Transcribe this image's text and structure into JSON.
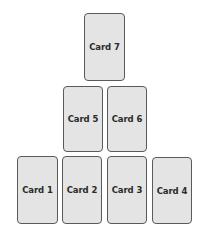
{
  "diagram": {
    "title": "",
    "layout": "pyramid",
    "colors": {
      "card_fill": "#e4e4e4",
      "card_border": "#5a5a5a",
      "text": "#2a2a2a",
      "background": "#ffffff"
    },
    "cards": [
      {
        "label": "Card 1",
        "row": 3
      },
      {
        "label": "Card 2",
        "row": 3
      },
      {
        "label": "Card 3",
        "row": 3
      },
      {
        "label": "Card 4",
        "row": 3
      },
      {
        "label": "Card 5",
        "row": 2
      },
      {
        "label": "Card 6",
        "row": 2
      },
      {
        "label": "Card 7",
        "row": 1
      }
    ]
  }
}
